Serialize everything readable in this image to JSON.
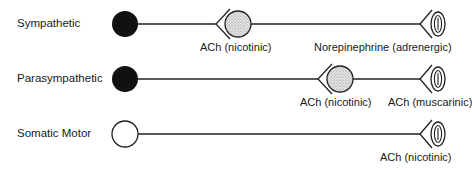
{
  "diagram": {
    "type": "autonomic and somatic efferent pathways",
    "rows": [
      {
        "name": "Sympathetic",
        "soma": "filled",
        "ganglion": {
          "present": true,
          "receptor_label": "ACh (nicotinic)"
        },
        "target": {
          "receptor_label": "Norepinephrine (adrenergic)"
        }
      },
      {
        "name": "Parasympathetic",
        "soma": "filled",
        "ganglion": {
          "present": true,
          "receptor_label": "ACh (nicotinic)"
        },
        "target": {
          "receptor_label": "ACh (muscarinic)"
        }
      },
      {
        "name": "Somatic Motor",
        "soma": "open",
        "ganglion": {
          "present": false
        },
        "target": {
          "receptor_label": "ACh (nicotinic)"
        }
      }
    ]
  }
}
